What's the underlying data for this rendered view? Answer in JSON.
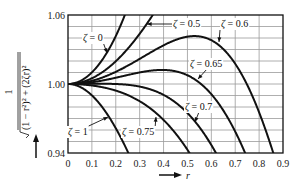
{
  "chart_data": {
    "type": "line",
    "title": "",
    "xlabel": "r",
    "ylabel": "1 / √((1 − r²)² + (2ζr)²)",
    "ylabel_parts": {
      "numerator": "1",
      "denominator": "(1 − r²)² + (2ζr)²"
    },
    "xlim": [
      0,
      0.9
    ],
    "ylim": [
      0.94,
      1.06
    ],
    "x_ticks": [
      "0",
      "0.1",
      "0.2",
      "0.3",
      "0.4",
      "0.5",
      "0.6",
      "0.7",
      "0.8",
      "0.9"
    ],
    "y_ticks": [
      "0.94",
      "1.00",
      "1.06"
    ],
    "grid": true,
    "grid_y_step": 0.01,
    "grid_x_step": 0.1,
    "series": [
      {
        "name": "ζ = 0",
        "zeta": 0
      },
      {
        "name": "ζ = 0.5",
        "zeta": 0.5
      },
      {
        "name": "ζ = 0.6",
        "zeta": 0.6
      },
      {
        "name": "ζ = 0.65",
        "zeta": 0.65
      },
      {
        "name": "ζ = 0.7",
        "zeta": 0.7
      },
      {
        "name": "ζ = 0.75",
        "zeta": 0.75
      },
      {
        "name": "ζ = 1",
        "zeta": 1
      }
    ],
    "annotations": [
      {
        "text": "ζ = 0",
        "x": 83,
        "y": 41,
        "ax": 107,
        "ay": 53
      },
      {
        "text": "ζ = 0.5",
        "x": 173,
        "y": 27,
        "ax": 147,
        "ay": 24
      },
      {
        "text": "ζ = 0.6",
        "x": 221,
        "y": 27,
        "ax": 219,
        "ay": 42
      },
      {
        "text": "ζ = 0.65",
        "x": 190,
        "y": 67,
        "ax": 198,
        "ay": 79
      },
      {
        "text": "ζ = 0.7",
        "x": 185,
        "y": 110,
        "ax": 195,
        "ay": 122
      },
      {
        "text": "ζ = 1",
        "x": 68,
        "y": 135,
        "ax": 108,
        "ay": 117
      },
      {
        "text": "ζ = 0.75",
        "x": 122,
        "y": 135,
        "ax": 156,
        "ay": 117
      }
    ]
  },
  "layout": {
    "plot": {
      "left": 68,
      "top": 15,
      "right": 283,
      "bottom": 153
    },
    "colors": {
      "line": "#111111",
      "grid": "#9a9a9a",
      "axis": "#111111"
    }
  },
  "labels": {
    "x_axis": "r",
    "x_arrow": "→",
    "y_arrow": "↑"
  }
}
